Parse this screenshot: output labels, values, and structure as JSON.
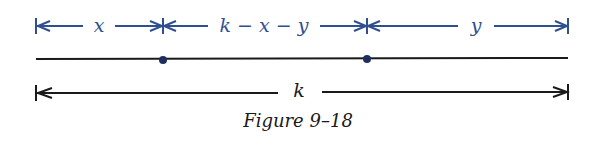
{
  "figure": {
    "caption": "Figure 9–18",
    "colors": {
      "blue": "#2f4f8f",
      "black": "#1a1a1a",
      "dot": "#1e2f5e"
    },
    "top_segments": [
      {
        "label": "x",
        "from": 36,
        "to": 163
      },
      {
        "label": "k − x − y",
        "from": 163,
        "to": 367
      },
      {
        "label": "y",
        "from": 367,
        "to": 568
      }
    ],
    "main_line": {
      "from": 36,
      "to": 568
    },
    "points": [
      163,
      367
    ],
    "total": {
      "label": "k",
      "from": 36,
      "to": 568
    }
  }
}
